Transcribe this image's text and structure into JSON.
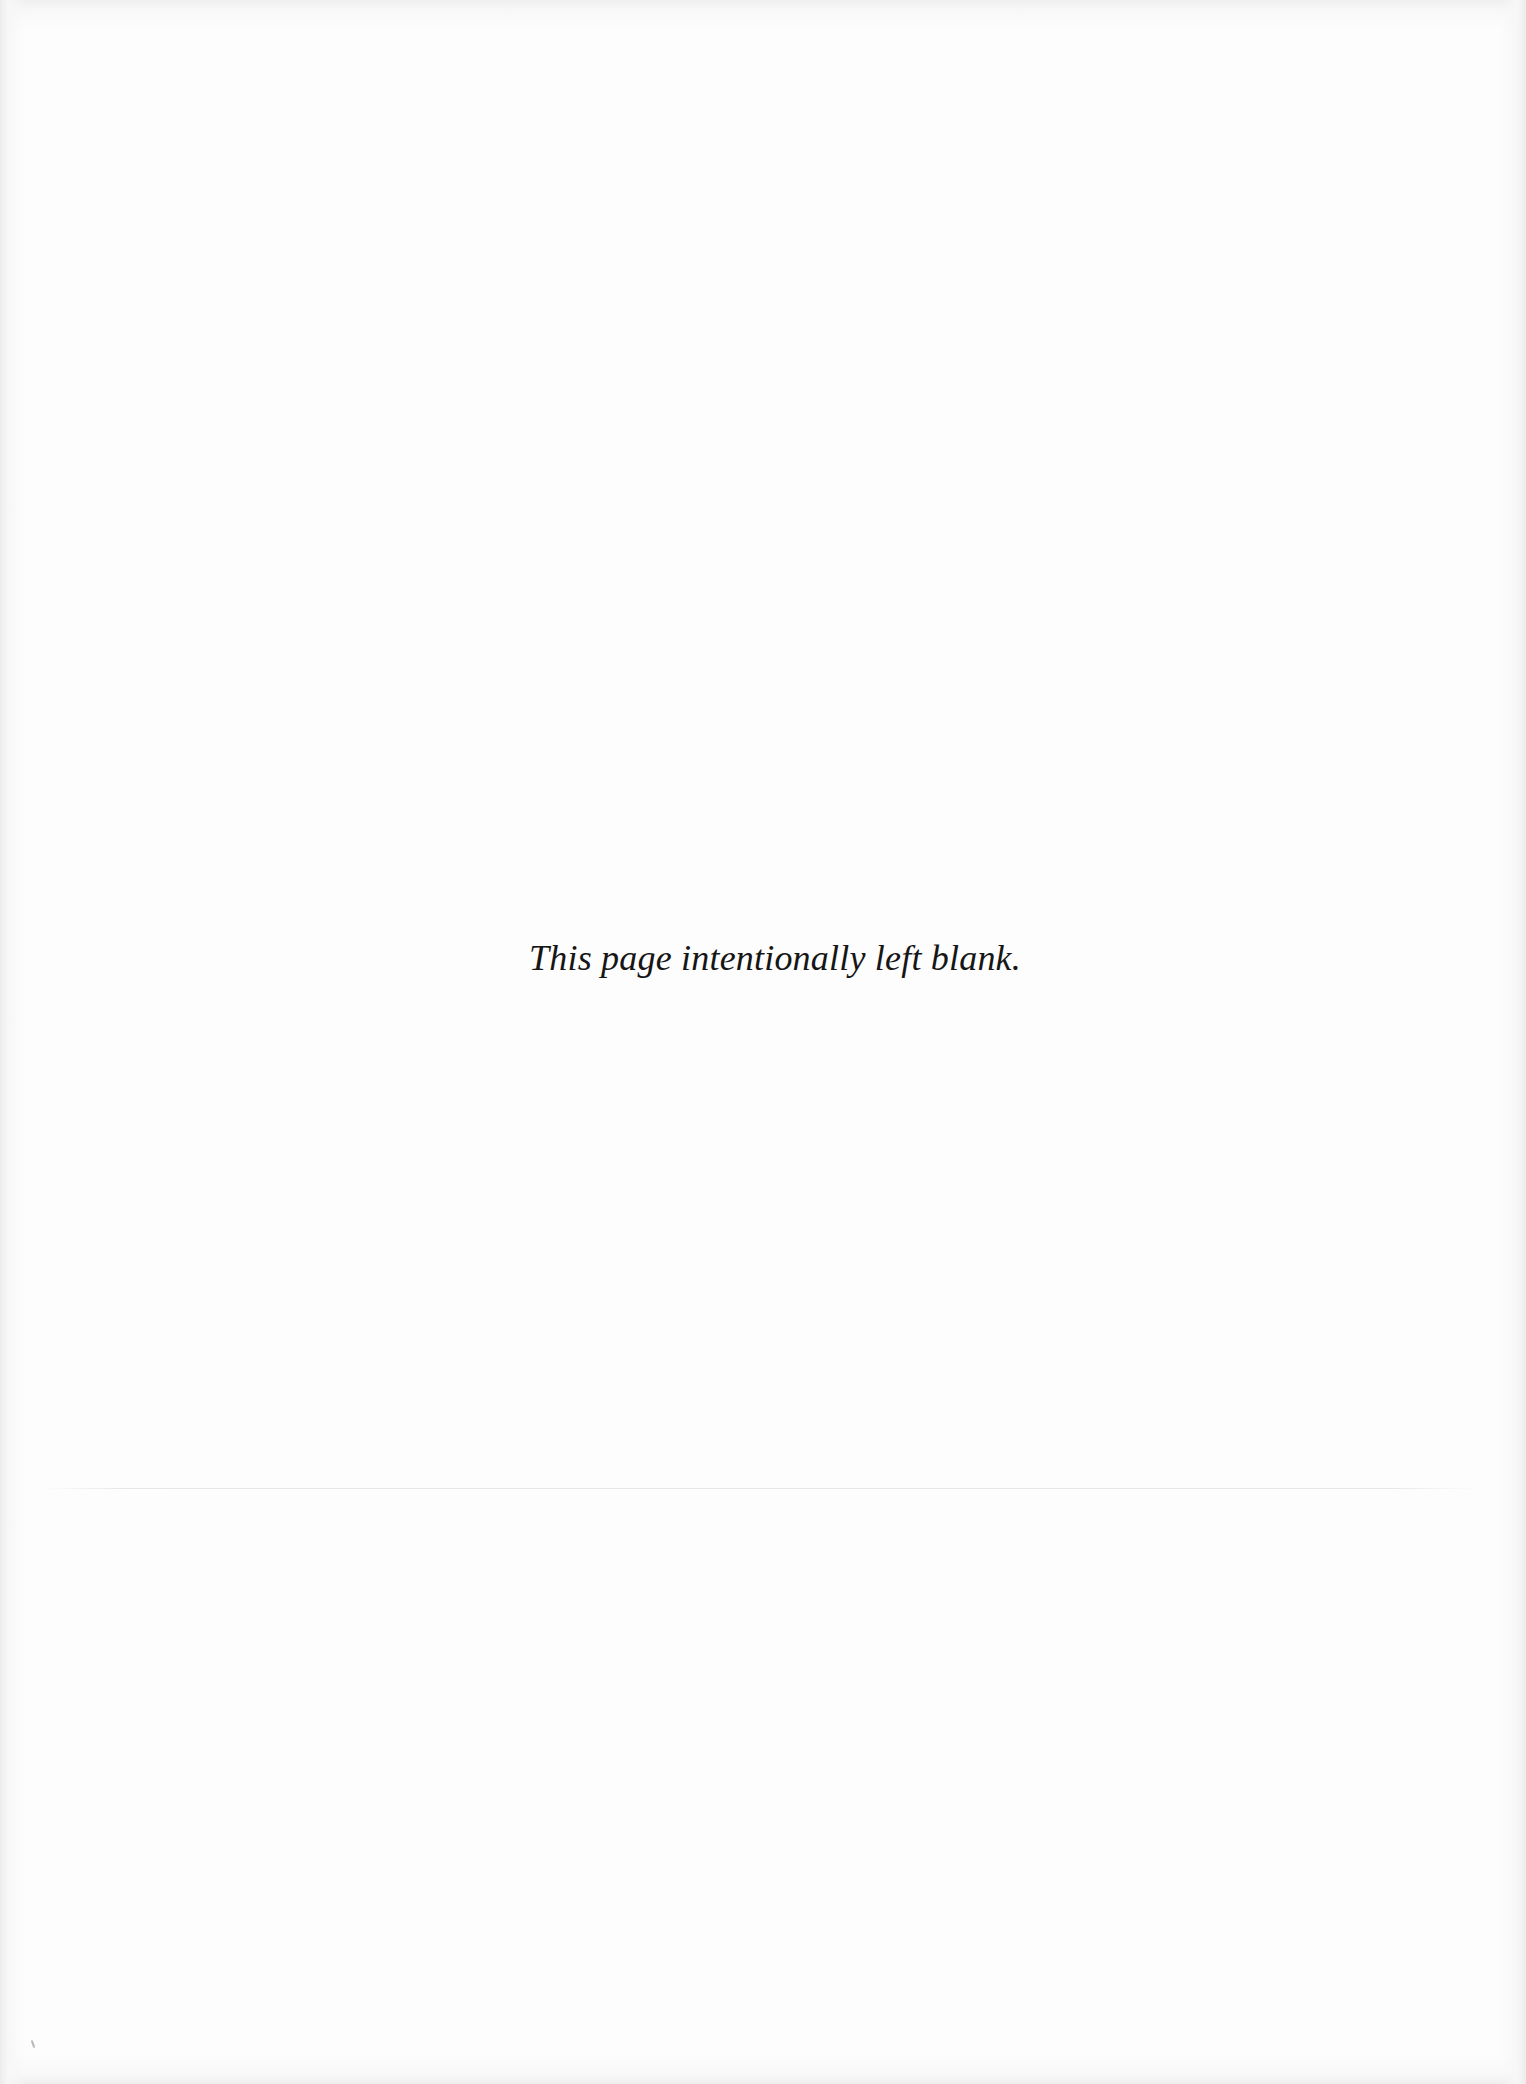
{
  "page": {
    "notice": "This page intentionally left blank.",
    "background_color": "#fdfdfd",
    "text_color": "#161616"
  }
}
